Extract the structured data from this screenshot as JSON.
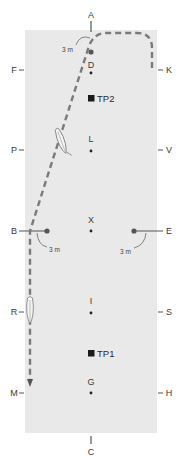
{
  "diagram": {
    "colors": {
      "arena_fill": "#e9e9e9",
      "path": "#7a7a7a",
      "marker": "#3a3a3a",
      "text": "#3a3a3a"
    },
    "arena": {
      "x": 25,
      "y": 30,
      "width": 132,
      "height": 403
    },
    "letters": {
      "top": {
        "label": "A"
      },
      "bottom": {
        "label": "C"
      },
      "left": [
        {
          "label": "F",
          "y": 70
        },
        {
          "label": "P",
          "y": 150
        },
        {
          "label": "B",
          "y": 231
        },
        {
          "label": "R",
          "y": 312
        },
        {
          "label": "M",
          "y": 393
        }
      ],
      "right": [
        {
          "label": "K",
          "y": 70
        },
        {
          "label": "V",
          "y": 150
        },
        {
          "label": "E",
          "y": 231
        },
        {
          "label": "S",
          "y": 312
        },
        {
          "label": "H",
          "y": 393
        }
      ],
      "center_line": [
        {
          "label": "D",
          "y": 72
        },
        {
          "label": "L",
          "y": 150
        },
        {
          "label": "X",
          "y": 231
        },
        {
          "label": "I",
          "y": 312
        },
        {
          "label": "G",
          "y": 393
        }
      ]
    },
    "markers": {
      "tp2": {
        "label": "TP2",
        "y": 98
      },
      "tp1": {
        "label": "TP1",
        "y": 353
      }
    },
    "distances": {
      "near_a": "3 m",
      "near_b": "3 m",
      "near_e": "3 m"
    },
    "path": {
      "description": "Dashed route from K around the corner toward A, diagonal across to B, then straight down the long side past R to M",
      "arrow_end": "M"
    },
    "horses": [
      {
        "position": "between P and L on diagonal"
      },
      {
        "position": "at R on long side"
      }
    ]
  }
}
